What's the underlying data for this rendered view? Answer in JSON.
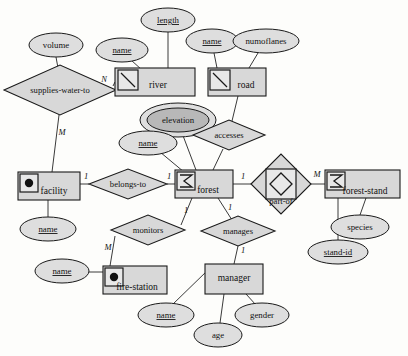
{
  "diagram": {
    "notation": "entity-relationship",
    "colors": {
      "background": "#fdfdfb",
      "shape_fill": "#d8d8d8",
      "attribute_fill": "#dedede",
      "attribute_inner_fill": "#b8b8b8",
      "stroke": "#1a1a1a",
      "connector": "#3a3a3a"
    },
    "entities": [
      {
        "id": "river",
        "label": "river",
        "icon": "polyline-icon",
        "x": 115,
        "y": 68,
        "w": 80,
        "h": 28
      },
      {
        "id": "road",
        "label": "road",
        "icon": "polyline-icon",
        "x": 208,
        "y": 68,
        "w": 58,
        "h": 28
      },
      {
        "id": "facility",
        "label": "facility",
        "icon": "point-icon",
        "x": 18,
        "y": 172,
        "w": 62,
        "h": 28
      },
      {
        "id": "forest",
        "label": "forest",
        "icon": "polygon-sigma-icon",
        "x": 175,
        "y": 170,
        "w": 58,
        "h": 28
      },
      {
        "id": "forest-stand",
        "label": "forest-stand",
        "icon": "polygon-sigma-icon",
        "x": 325,
        "y": 170,
        "w": 75,
        "h": 28
      },
      {
        "id": "fire-station",
        "label": "fire-station",
        "icon": "point-icon",
        "x": 103,
        "y": 266,
        "w": 64,
        "h": 28
      },
      {
        "id": "manager",
        "label": "manager",
        "icon": "none",
        "x": 205,
        "y": 264,
        "w": 58,
        "h": 30
      }
    ],
    "relationships": [
      {
        "id": "supplies-water-to",
        "label": "supplies-water-to",
        "weak": false,
        "cx": 60,
        "cy": 90,
        "rx": 56,
        "ry": 25
      },
      {
        "id": "accesses",
        "label": "accesses",
        "weak": false,
        "cx": 229,
        "cy": 135,
        "rx": 36,
        "ry": 15
      },
      {
        "id": "belongs-to",
        "label": "belongs-to",
        "weak": false,
        "cx": 128,
        "cy": 184,
        "rx": 39,
        "ry": 15
      },
      {
        "id": "part-of",
        "label": "part-of",
        "weak": true,
        "cx": 281,
        "cy": 184,
        "rx": 30,
        "ry": 30
      },
      {
        "id": "monitors",
        "label": "monitors",
        "weak": false,
        "cx": 148,
        "cy": 230,
        "rx": 37,
        "ry": 15
      },
      {
        "id": "manages",
        "label": "manages",
        "weak": false,
        "cx": 238,
        "cy": 231,
        "rx": 37,
        "ry": 15
      }
    ],
    "attributes": [
      {
        "id": "volume",
        "label": "volume",
        "key": false,
        "multivalued": false,
        "cx": 56,
        "cy": 45,
        "rx": 27,
        "ry": 12
      },
      {
        "id": "river-name",
        "label": "name",
        "key": true,
        "multivalued": false,
        "cx": 122,
        "cy": 50,
        "rx": 26,
        "ry": 12
      },
      {
        "id": "length",
        "label": "length",
        "key": true,
        "multivalued": false,
        "cx": 168,
        "cy": 20,
        "rx": 27,
        "ry": 12
      },
      {
        "id": "road-name",
        "label": "name",
        "key": true,
        "multivalued": false,
        "cx": 212,
        "cy": 41,
        "rx": 26,
        "ry": 12
      },
      {
        "id": "numoflanes",
        "label": "numoflanes",
        "key": false,
        "multivalued": false,
        "cx": 266,
        "cy": 41,
        "rx": 33,
        "ry": 12
      },
      {
        "id": "elevation",
        "label": "elevation",
        "key": false,
        "multivalued": true,
        "cx": 178,
        "cy": 120,
        "rx": 31,
        "ry": 13
      },
      {
        "id": "forest-name",
        "label": "name",
        "key": true,
        "multivalued": false,
        "cx": 148,
        "cy": 143,
        "rx": 26,
        "ry": 12
      },
      {
        "id": "facility-name",
        "label": "name",
        "key": true,
        "multivalued": false,
        "cx": 48,
        "cy": 229,
        "rx": 26,
        "ry": 12
      },
      {
        "id": "firestation-name",
        "label": "name",
        "key": true,
        "multivalued": false,
        "cx": 62,
        "cy": 271,
        "rx": 26,
        "ry": 12
      },
      {
        "id": "manager-name",
        "label": "name",
        "key": true,
        "multivalued": false,
        "cx": 166,
        "cy": 315,
        "rx": 26,
        "ry": 12
      },
      {
        "id": "age",
        "label": "age",
        "key": false,
        "multivalued": false,
        "cx": 218,
        "cy": 335,
        "rx": 22,
        "ry": 12
      },
      {
        "id": "gender",
        "label": "gender",
        "key": false,
        "multivalued": false,
        "cx": 262,
        "cy": 315,
        "rx": 26,
        "ry": 12
      },
      {
        "id": "species",
        "label": "species",
        "key": false,
        "multivalued": false,
        "cx": 360,
        "cy": 227,
        "rx": 28,
        "ry": 12
      },
      {
        "id": "stand-id",
        "label": "stand-id",
        "key": true,
        "multivalued": false,
        "cx": 338,
        "cy": 252,
        "rx": 28,
        "ry": 12
      }
    ],
    "cardinalities": [
      {
        "id": "card-supplies-river",
        "label": "N",
        "x": 104,
        "y": 80
      },
      {
        "id": "card-supplies-facility",
        "label": "M",
        "x": 62,
        "y": 133
      },
      {
        "id": "card-facility-belongs",
        "label": "1",
        "x": 86,
        "y": 177
      },
      {
        "id": "card-belongs-forest",
        "label": "1",
        "x": 169,
        "y": 177
      },
      {
        "id": "card-forest-partof",
        "label": "1",
        "x": 243,
        "y": 177
      },
      {
        "id": "card-partof-stand",
        "label": "M",
        "x": 314,
        "y": 175
      },
      {
        "id": "card-forest-monitors",
        "label": "1",
        "x": 186,
        "y": 211
      },
      {
        "id": "card-monitors-fire",
        "label": "M",
        "x": 108,
        "y": 248
      },
      {
        "id": "card-forest-manages",
        "label": "1",
        "x": 230,
        "y": 208
      },
      {
        "id": "card-manages-manager",
        "label": "1",
        "x": 243,
        "y": 251
      }
    ],
    "connections": [
      {
        "id": "conn-volume-supplies",
        "from": "volume",
        "to": "supplies-water-to"
      },
      {
        "id": "conn-supplies-river",
        "from": "supplies-water-to",
        "to": "river"
      },
      {
        "id": "conn-supplies-facility",
        "from": "supplies-water-to",
        "to": "facility"
      },
      {
        "id": "conn-rivername-river",
        "from": "river-name",
        "to": "river"
      },
      {
        "id": "conn-length-river",
        "from": "length",
        "to": "river"
      },
      {
        "id": "conn-roadname-road",
        "from": "road-name",
        "to": "road"
      },
      {
        "id": "conn-numoflanes-road",
        "from": "numoflanes",
        "to": "road"
      },
      {
        "id": "conn-road-accesses",
        "from": "road",
        "to": "accesses"
      },
      {
        "id": "conn-accesses-forest",
        "from": "accesses",
        "to": "forest"
      },
      {
        "id": "conn-elevation-forest",
        "from": "elevation",
        "to": "forest"
      },
      {
        "id": "conn-forestname-forest",
        "from": "forest-name",
        "to": "forest"
      },
      {
        "id": "conn-facility-belongs",
        "from": "facility",
        "to": "belongs-to"
      },
      {
        "id": "conn-belongs-forest",
        "from": "belongs-to",
        "to": "forest"
      },
      {
        "id": "conn-facilityname-facility",
        "from": "facility-name",
        "to": "facility"
      },
      {
        "id": "conn-forest-partof",
        "from": "forest",
        "to": "part-of"
      },
      {
        "id": "conn-partof-stand",
        "from": "part-of",
        "to": "forest-stand"
      },
      {
        "id": "conn-species-stand",
        "from": "species",
        "to": "forest-stand"
      },
      {
        "id": "conn-standid-stand",
        "from": "stand-id",
        "to": "forest-stand"
      },
      {
        "id": "conn-forest-monitors",
        "from": "forest",
        "to": "monitors"
      },
      {
        "id": "conn-monitors-fire",
        "from": "monitors",
        "to": "fire-station"
      },
      {
        "id": "conn-firename-fire",
        "from": "firestation-name",
        "to": "fire-station"
      },
      {
        "id": "conn-forest-manages",
        "from": "forest",
        "to": "manages"
      },
      {
        "id": "conn-manages-manager",
        "from": "manages",
        "to": "manager"
      },
      {
        "id": "conn-managername-manager",
        "from": "manager-name",
        "to": "manager"
      },
      {
        "id": "conn-age-manager",
        "from": "age",
        "to": "manager"
      },
      {
        "id": "conn-gender-manager",
        "from": "gender",
        "to": "manager"
      }
    ]
  }
}
